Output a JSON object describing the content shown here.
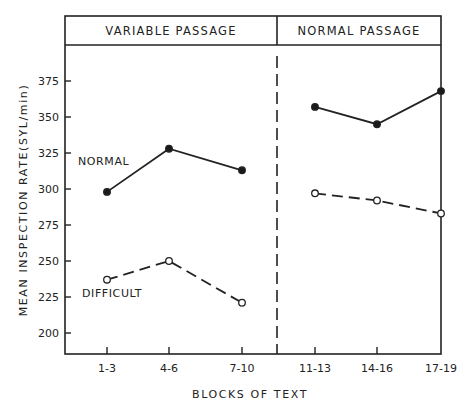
{
  "chart_data": {
    "type": "line",
    "title": "",
    "panels": [
      {
        "label": "VARIABLE PASSAGE",
        "categories": [
          "1-3",
          "4-6",
          "7-10"
        ]
      },
      {
        "label": "NORMAL PASSAGE",
        "categories": [
          "11-13",
          "14-16",
          "17-19"
        ]
      }
    ],
    "categories": [
      "1-3",
      "4-6",
      "7-10",
      "11-13",
      "14-16",
      "17-19"
    ],
    "series": [
      {
        "name": "NORMAL",
        "marker": "filled-circle",
        "line": "solid",
        "values": [
          298,
          328,
          313,
          357,
          345,
          368
        ]
      },
      {
        "name": "DIFFICULT",
        "marker": "open-circle",
        "line": "dashed",
        "values": [
          237,
          250,
          221,
          297,
          292,
          283
        ]
      }
    ],
    "xlabel": "BLOCKS OF TEXT",
    "ylabel": "MEAN INSPECTION RATE (SYL/min)",
    "yticks": [
      200,
      225,
      250,
      275,
      300,
      325,
      350,
      375
    ],
    "ylim": [
      185,
      400
    ],
    "grid": false,
    "legend": "inline labels"
  },
  "labels": {
    "panel_left": "VARIABLE PASSAGE",
    "panel_right": "NORMAL PASSAGE",
    "xlabel": "BLOCKS OF TEXT",
    "ylabel": "MEAN INSPECTION RATE(SYL/min)",
    "series_normal": "NORMAL",
    "series_difficult": "DIFFICULT"
  }
}
